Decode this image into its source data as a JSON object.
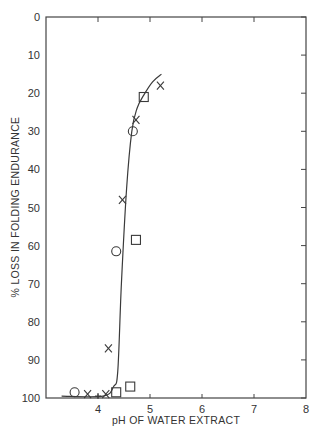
{
  "chart_data": {
    "type": "scatter",
    "title": "",
    "xlabel": "pH OF WATER EXTRACT",
    "ylabel": "% LOSS IN FOLDING ENDURANCE",
    "xlim": [
      3,
      8
    ],
    "ylim": [
      100,
      0
    ],
    "y_inverted": true,
    "grid": false,
    "legend": null,
    "x_ticks": [
      4,
      5,
      6,
      7,
      8
    ],
    "x_tick_labels": [
      "4",
      "5",
      "6",
      "7",
      "8"
    ],
    "y_ticks": [
      0,
      10,
      20,
      30,
      40,
      50,
      60,
      70,
      80,
      90,
      100
    ],
    "y_tick_labels": [
      "0",
      "10",
      "20",
      "30",
      "40",
      "50",
      "60",
      "70",
      "80",
      "90",
      "100"
    ],
    "series": [
      {
        "name": "circles",
        "marker": "circle",
        "points": [
          {
            "x": 3.55,
            "y": 98.5
          },
          {
            "x": 4.35,
            "y": 61.5
          },
          {
            "x": 4.67,
            "y": 30
          }
        ]
      },
      {
        "name": "crosses",
        "marker": "x",
        "points": [
          {
            "x": 3.8,
            "y": 99
          },
          {
            "x": 4.15,
            "y": 99
          },
          {
            "x": 4.2,
            "y": 87
          },
          {
            "x": 4.47,
            "y": 48
          },
          {
            "x": 4.73,
            "y": 27
          },
          {
            "x": 5.2,
            "y": 18
          }
        ]
      },
      {
        "name": "squares",
        "marker": "square",
        "points": [
          {
            "x": 4.35,
            "y": 98.5
          },
          {
            "x": 4.62,
            "y": 97
          },
          {
            "x": 4.73,
            "y": 58.5
          },
          {
            "x": 4.88,
            "y": 21
          }
        ]
      },
      {
        "name": "plus",
        "marker": "plus",
        "points": [
          {
            "x": 4.0,
            "y": 99.5
          }
        ]
      }
    ],
    "fit_curve": {
      "name": "trend",
      "type": "line",
      "points": [
        {
          "x": 3.3,
          "y": 99.5
        },
        {
          "x": 4.1,
          "y": 99.5
        },
        {
          "x": 4.3,
          "y": 97
        },
        {
          "x": 4.38,
          "y": 93
        },
        {
          "x": 4.45,
          "y": 70
        },
        {
          "x": 4.55,
          "y": 45
        },
        {
          "x": 4.65,
          "y": 30
        },
        {
          "x": 4.75,
          "y": 24
        },
        {
          "x": 4.88,
          "y": 20.5
        },
        {
          "x": 5.05,
          "y": 17
        },
        {
          "x": 5.22,
          "y": 15
        }
      ]
    }
  }
}
